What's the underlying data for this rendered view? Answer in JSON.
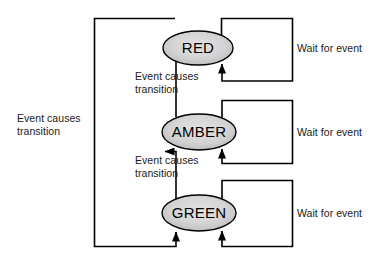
{
  "diagram": {
    "type": "state-machine",
    "states": [
      {
        "id": "red",
        "label": "RED",
        "cx": 198,
        "cy": 48,
        "rx": 35,
        "ry": 17,
        "fill": "#d2d2d2",
        "stroke": "#000000"
      },
      {
        "id": "amber",
        "label": "AMBER",
        "cx": 199,
        "cy": 132,
        "rx": 37,
        "ry": 18,
        "fill": "#d2d2d2",
        "stroke": "#000000"
      },
      {
        "id": "green",
        "label": "GREEN",
        "cx": 199,
        "cy": 213,
        "rx": 37,
        "ry": 18,
        "fill": "#d2d2d2",
        "stroke": "#000000"
      }
    ],
    "self_loops": [
      {
        "id": "red-wait",
        "state": "red",
        "label": "Wait for event",
        "label_x": 297,
        "label_y": 41
      },
      {
        "id": "amber-wait",
        "state": "amber",
        "label": "Wait for event",
        "label_x": 297,
        "label_y": 126
      },
      {
        "id": "green-wait",
        "state": "green",
        "label": "Wait for event",
        "label_x": 297,
        "label_y": 207
      }
    ],
    "transitions": [
      {
        "id": "amber-to-red",
        "from": "amber",
        "to": "red",
        "label_line1": "Event causes",
        "label_line2": "transition",
        "label_x": 135,
        "label_y": 72
      },
      {
        "id": "green-to-amber",
        "from": "green",
        "to": "amber",
        "label_line1": "Event causes",
        "label_line2": "transition",
        "label_x": 135,
        "label_y": 156
      },
      {
        "id": "red-to-green",
        "from": "red",
        "to": "green",
        "label_line1": "Event causes",
        "label_line2": "transition",
        "label_x": 17,
        "label_y": 118
      }
    ],
    "colors": {
      "stroke": "#000000",
      "state_fill": "#d2d2d2",
      "text": "#1a1a1a",
      "background": "#ffffff"
    }
  }
}
